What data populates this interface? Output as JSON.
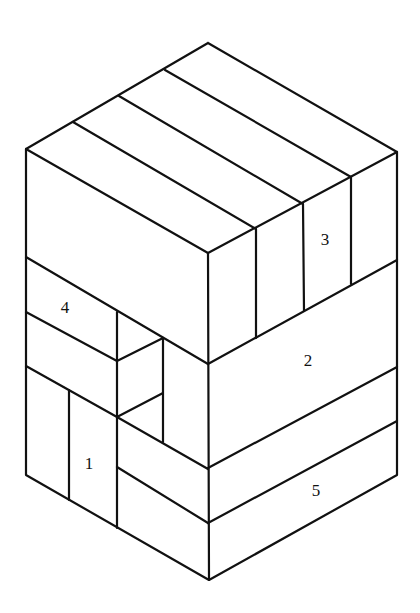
{
  "diagram": {
    "type": "isometric-block-assembly",
    "labels": [
      {
        "id": "block-1",
        "text": "1",
        "x": 89,
        "y": 463
      },
      {
        "id": "block-2",
        "text": "2",
        "x": 308,
        "y": 360
      },
      {
        "id": "block-3",
        "text": "3",
        "x": 325,
        "y": 239
      },
      {
        "id": "block-4",
        "text": "4",
        "x": 65,
        "y": 307
      },
      {
        "id": "block-5",
        "text": "5",
        "x": 316,
        "y": 490
      }
    ],
    "colors": {
      "stroke": "#111111",
      "background": "#ffffff"
    }
  }
}
